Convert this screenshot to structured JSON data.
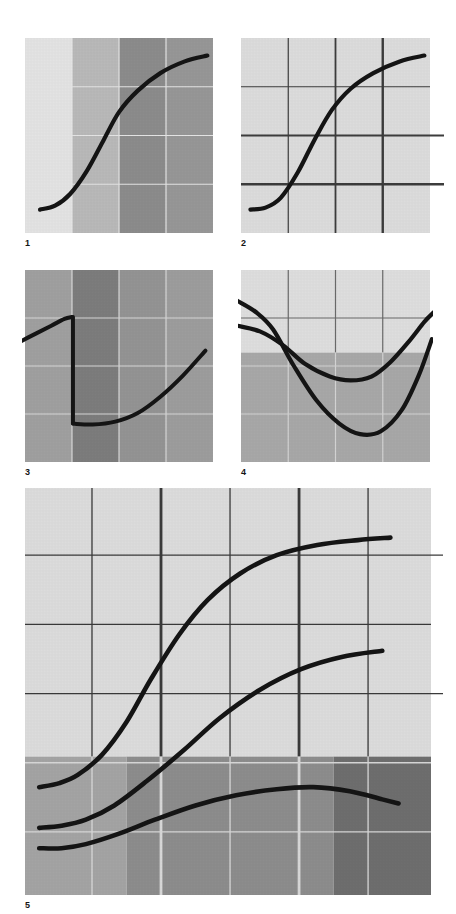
{
  "page": {
    "background": "#ffffff",
    "width": 456,
    "height": 914,
    "curve_color": "#151515"
  },
  "palette": {
    "near_white": "#ebebeb",
    "very_light": "#e3e3e3",
    "light": "#d6d6d6",
    "light_mid": "#c2c2c2",
    "mid": "#adadad",
    "mid_dark": "#999999",
    "dark": "#8a8a8a",
    "darker": "#7a7a7a",
    "darkest": "#6b6b6b",
    "grid_dark": "#3a3a3a",
    "grid_light": "#e6e6e6",
    "curve": "#151515"
  },
  "panels": [
    {
      "id": "panel-1",
      "label": "1",
      "caption": "1",
      "x": 25,
      "y": 38,
      "w": 188,
      "h": 195,
      "background_type": "vertical-bands",
      "bands": [
        {
          "from": 0.0,
          "to": 0.25,
          "color": "#e3e3e3"
        },
        {
          "from": 0.25,
          "to": 0.5,
          "color": "#b9b9b9"
        },
        {
          "from": 0.5,
          "to": 0.75,
          "color": "#8c8c8c"
        },
        {
          "from": 0.75,
          "to": 1.0,
          "color": "#979797"
        }
      ],
      "grid": {
        "style": "light",
        "color": "#e4e4e4",
        "vertical": [
          0.25,
          0.5,
          0.75
        ],
        "horizontal": [
          0.25,
          0.5,
          0.75
        ],
        "weights_v": [
          1.2,
          1.2,
          1.2
        ],
        "weights_h": [
          1.2,
          1.2,
          1.2
        ],
        "overhang": 0
      },
      "curves": [
        {
          "name": "s-curve",
          "width": 4.2,
          "points": [
            [
              0.08,
              0.88
            ],
            [
              0.16,
              0.86
            ],
            [
              0.24,
              0.8
            ],
            [
              0.33,
              0.68
            ],
            [
              0.42,
              0.52
            ],
            [
              0.5,
              0.38
            ],
            [
              0.6,
              0.27
            ],
            [
              0.72,
              0.18
            ],
            [
              0.85,
              0.12
            ],
            [
              0.97,
              0.09
            ]
          ]
        }
      ]
    },
    {
      "id": "panel-2",
      "label": "2",
      "caption": "2",
      "x": 241,
      "y": 38,
      "w": 189,
      "h": 195,
      "background_type": "flat",
      "bands": [
        {
          "from": 0.0,
          "to": 1.0,
          "color": "#dcdcdc"
        }
      ],
      "grid": {
        "style": "dark",
        "color": "#3c3c3c",
        "vertical": [
          0.25,
          0.5,
          0.75
        ],
        "horizontal": [
          0.25,
          0.5,
          0.75
        ],
        "weights_v": [
          1.2,
          1.8,
          2.4
        ],
        "weights_h": [
          1.2,
          1.8,
          2.4
        ],
        "overhang": 14,
        "overhang_rows": [
          1,
          2
        ]
      },
      "curves": [
        {
          "name": "s-curve",
          "width": 4.2,
          "points": [
            [
              0.05,
              0.88
            ],
            [
              0.13,
              0.87
            ],
            [
              0.21,
              0.82
            ],
            [
              0.3,
              0.69
            ],
            [
              0.39,
              0.52
            ],
            [
              0.48,
              0.37
            ],
            [
              0.58,
              0.26
            ],
            [
              0.7,
              0.18
            ],
            [
              0.84,
              0.12
            ],
            [
              0.97,
              0.09
            ]
          ]
        }
      ]
    },
    {
      "id": "panel-3",
      "label": "3",
      "caption": "3",
      "x": 25,
      "y": 270,
      "w": 188,
      "h": 192,
      "background_type": "vertical-bands",
      "bands": [
        {
          "from": 0.0,
          "to": 0.25,
          "color": "#a0a0a0"
        },
        {
          "from": 0.25,
          "to": 0.5,
          "color": "#7d7d7d"
        },
        {
          "from": 0.5,
          "to": 0.75,
          "color": "#949494"
        },
        {
          "from": 0.75,
          "to": 1.0,
          "color": "#9d9d9d"
        }
      ],
      "grid": {
        "style": "light",
        "color": "#d8d8d8",
        "vertical": [
          0.25,
          0.5,
          0.75
        ],
        "horizontal": [
          0.25,
          0.5,
          0.75
        ],
        "weights_v": [
          1.2,
          1.2,
          1.2
        ],
        "weights_h": [
          1.2,
          1.2,
          1.2
        ],
        "overhang": 0
      },
      "curves": [
        {
          "name": "branch-upper-left",
          "width": 4.0,
          "points": [
            [
              -0.04,
              0.38
            ],
            [
              0.06,
              0.33
            ],
            [
              0.14,
              0.29
            ],
            [
              0.21,
              0.255
            ],
            [
              0.25,
              0.245
            ]
          ]
        },
        {
          "name": "discontinuity-drop",
          "width": 4.0,
          "points": [
            [
              0.255,
              0.245
            ],
            [
              0.255,
              0.55
            ],
            [
              0.255,
              0.8
            ]
          ]
        },
        {
          "name": "branch-lower-right",
          "width": 4.0,
          "points": [
            [
              0.255,
              0.8
            ],
            [
              0.36,
              0.805
            ],
            [
              0.48,
              0.79
            ],
            [
              0.6,
              0.745
            ],
            [
              0.72,
              0.66
            ],
            [
              0.84,
              0.55
            ],
            [
              0.96,
              0.42
            ]
          ]
        }
      ]
    },
    {
      "id": "panel-4",
      "label": "4",
      "caption": "4",
      "x": 241,
      "y": 270,
      "w": 189,
      "h": 192,
      "background_type": "horizontal-bands",
      "bands": [
        {
          "from": 0.0,
          "to": 0.43,
          "color": "#dedede"
        },
        {
          "from": 0.43,
          "to": 1.0,
          "color": "#a8a8a8"
        }
      ],
      "grid": {
        "style": "split",
        "color": "#6a6a6a",
        "color_on_dark": "#d3d3d3",
        "split_at": 0.43,
        "vertical": [
          0.25,
          0.5,
          0.75
        ],
        "horizontal": [
          0.25,
          0.5,
          0.75
        ],
        "weights_v": [
          1.2,
          1.2,
          1.2
        ],
        "weights_h": [
          1.2,
          1.2,
          1.2
        ],
        "overhang": 0
      },
      "curves": [
        {
          "name": "deep-u-curve",
          "width": 4.2,
          "points": [
            [
              -0.02,
              0.16
            ],
            [
              0.08,
              0.22
            ],
            [
              0.17,
              0.31
            ],
            [
              0.28,
              0.5
            ],
            [
              0.4,
              0.68
            ],
            [
              0.52,
              0.8
            ],
            [
              0.63,
              0.855
            ],
            [
              0.74,
              0.84
            ],
            [
              0.85,
              0.73
            ],
            [
              0.94,
              0.55
            ],
            [
              1.01,
              0.36
            ]
          ]
        },
        {
          "name": "shallow-u-curve",
          "width": 4.2,
          "points": [
            [
              -0.02,
              0.29
            ],
            [
              0.1,
              0.32
            ],
            [
              0.22,
              0.39
            ],
            [
              0.34,
              0.49
            ],
            [
              0.47,
              0.555
            ],
            [
              0.58,
              0.575
            ],
            [
              0.69,
              0.555
            ],
            [
              0.79,
              0.48
            ],
            [
              0.89,
              0.37
            ],
            [
              0.97,
              0.27
            ],
            [
              1.02,
              0.22
            ]
          ]
        }
      ]
    },
    {
      "id": "panel-5",
      "label": "5",
      "caption": "5",
      "x": 25,
      "y": 488,
      "w": 406,
      "h": 407,
      "background_type": "quadrant-bands",
      "top_color": "#dcdcdc",
      "split_at": 0.66,
      "bottom_bands": [
        {
          "from": 0.0,
          "to": 0.25,
          "color": "#a4a4a4"
        },
        {
          "from": 0.25,
          "to": 0.505,
          "color": "#8d8d8d"
        },
        {
          "from": 0.505,
          "to": 0.76,
          "color": "#8d8d8d"
        },
        {
          "from": 0.76,
          "to": 1.0,
          "color": "#6e6e6e"
        }
      ],
      "grid": {
        "style": "split",
        "color": "#3a3a3a",
        "color_on_dark": "#d8d8d8",
        "split_at": 0.66,
        "vertical": [
          0.165,
          0.335,
          0.505,
          0.675,
          0.845
        ],
        "horizontal": [
          0.165,
          0.335,
          0.505,
          0.675,
          0.845
        ],
        "weights_v": [
          1.3,
          2.8,
          1.3,
          2.8,
          1.3
        ],
        "weights_h": [
          1.3,
          1.3,
          1.3,
          1.3,
          1.3
        ],
        "overhang": 12,
        "overhang_rows": [
          0,
          2
        ]
      },
      "curves": [
        {
          "name": "top-sigmoid",
          "width": 4.6,
          "points": [
            [
              0.035,
              0.735
            ],
            [
              0.085,
              0.725
            ],
            [
              0.13,
              0.705
            ],
            [
              0.19,
              0.655
            ],
            [
              0.25,
              0.575
            ],
            [
              0.31,
              0.47
            ],
            [
              0.38,
              0.36
            ],
            [
              0.45,
              0.275
            ],
            [
              0.53,
              0.21
            ],
            [
              0.62,
              0.165
            ],
            [
              0.72,
              0.14
            ],
            [
              0.82,
              0.128
            ],
            [
              0.9,
              0.122
            ]
          ]
        },
        {
          "name": "middle-rising",
          "width": 4.6,
          "points": [
            [
              0.035,
              0.835
            ],
            [
              0.09,
              0.83
            ],
            [
              0.15,
              0.815
            ],
            [
              0.22,
              0.78
            ],
            [
              0.3,
              0.72
            ],
            [
              0.39,
              0.645
            ],
            [
              0.48,
              0.565
            ],
            [
              0.58,
              0.495
            ],
            [
              0.68,
              0.445
            ],
            [
              0.78,
              0.415
            ],
            [
              0.88,
              0.4
            ]
          ]
        },
        {
          "name": "bottom-hump",
          "width": 4.6,
          "points": [
            [
              0.035,
              0.885
            ],
            [
              0.09,
              0.885
            ],
            [
              0.15,
              0.875
            ],
            [
              0.23,
              0.85
            ],
            [
              0.32,
              0.815
            ],
            [
              0.42,
              0.78
            ],
            [
              0.52,
              0.755
            ],
            [
              0.62,
              0.74
            ],
            [
              0.71,
              0.735
            ],
            [
              0.8,
              0.745
            ],
            [
              0.88,
              0.765
            ],
            [
              0.92,
              0.775
            ]
          ]
        }
      ]
    }
  ]
}
